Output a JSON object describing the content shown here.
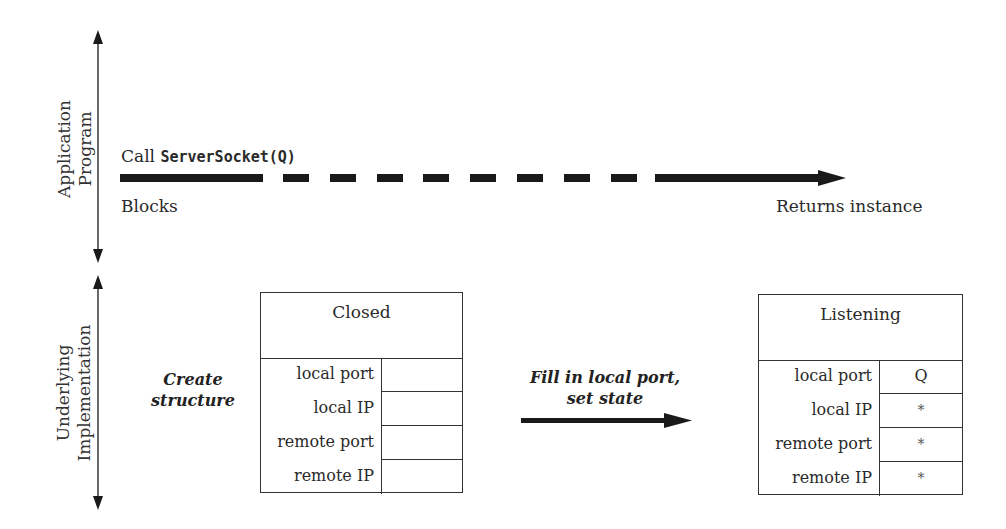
{
  "axes": {
    "top_label": [
      "Application",
      "Program"
    ],
    "bottom_label": [
      "Underlying",
      "Implementation"
    ]
  },
  "call": {
    "prefix": "Call",
    "code": "ServerSocket(Q)",
    "blocks_label": "Blocks",
    "returns_label": "Returns instance"
  },
  "steps": {
    "create": [
      "Create",
      "structure"
    ],
    "fill": [
      "Fill in local port,",
      "set state"
    ]
  },
  "closed_box": {
    "state": "Closed",
    "rows": [
      {
        "label": "local port",
        "value": ""
      },
      {
        "label": "local IP",
        "value": ""
      },
      {
        "label": "remote port",
        "value": ""
      },
      {
        "label": "remote IP",
        "value": ""
      }
    ]
  },
  "listening_box": {
    "state": "Listening",
    "rows": [
      {
        "label": "local port",
        "value": "Q"
      },
      {
        "label": "local IP",
        "value": "*"
      },
      {
        "label": "remote port",
        "value": "*"
      },
      {
        "label": "remote IP",
        "value": "*"
      }
    ]
  },
  "colors": {
    "line": "#1a1a1a",
    "text": "#2a2a2a",
    "box_border": "#333333"
  }
}
